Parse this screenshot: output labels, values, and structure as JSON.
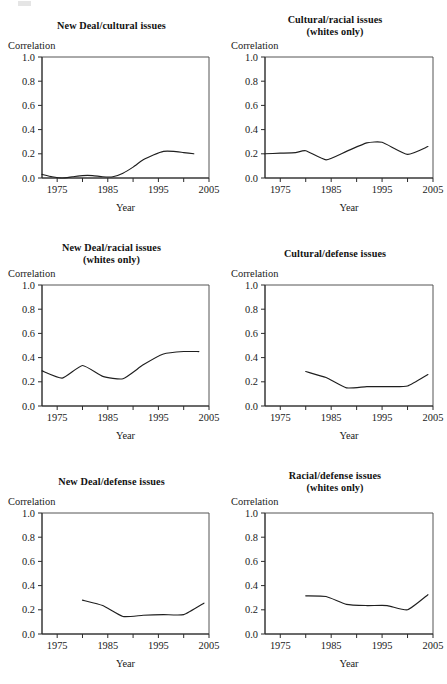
{
  "figure": {
    "axis_label_y": "Correlation",
    "axis_label_x": "Year",
    "y_ticks": [
      "0.0",
      "0.2",
      "0.4",
      "0.6",
      "0.8",
      "1.0"
    ],
    "x_ticks": [
      "1975",
      "1985",
      "1995",
      "2005"
    ],
    "line_color": "#1f1f1f",
    "frame_color": "#555555",
    "background": "#ffffff"
  },
  "panels": [
    {
      "id": "new-deal-cultural-issues",
      "title": "New Deal/cultural issues",
      "subtitle": "",
      "ylabel": "Correlation",
      "xlabel": "Year"
    },
    {
      "id": "cultural-racial-issues-whites-only",
      "title": "Cultural/racial issues",
      "subtitle": "(whites only)",
      "ylabel": "Correlation",
      "xlabel": "Year"
    },
    {
      "id": "new-deal-racial-issues-whites-only",
      "title": "New Deal/racial issues",
      "subtitle": "(whites only)",
      "ylabel": "Correlation",
      "xlabel": "Year"
    },
    {
      "id": "cultural-defense-issues",
      "title": "Cultural/defense issues",
      "subtitle": "",
      "ylabel": "Correlation",
      "xlabel": "Year"
    },
    {
      "id": "new-deal-defense-issues",
      "title": "New Deal/defense issues",
      "subtitle": "",
      "ylabel": "Correlation",
      "xlabel": "Year"
    },
    {
      "id": "racial-defense-issues-whites-only",
      "title": "Racial/defense issues",
      "subtitle": "(whites only)",
      "ylabel": "Correlation",
      "xlabel": "Year"
    }
  ],
  "chart_data": [
    {
      "type": "line",
      "title": "New Deal/cultural issues",
      "subtitle": "",
      "xlabel": "Year",
      "ylabel": "Correlation",
      "xlim": [
        1972,
        2005
      ],
      "ylim": [
        0.0,
        1.0
      ],
      "x_ticks": [
        1975,
        1985,
        1995,
        2005
      ],
      "y_ticks": [
        0.0,
        0.2,
        0.4,
        0.6,
        0.8,
        1.0
      ],
      "grid": false,
      "legend": "none",
      "x": [
        1972,
        1974,
        1976,
        1978,
        1980,
        1982,
        1984,
        1986,
        1988,
        1990,
        1992,
        1994,
        1996,
        1998,
        2000,
        2002
      ],
      "values": [
        0.03,
        0.01,
        0.0,
        0.01,
        0.02,
        0.02,
        0.01,
        0.01,
        0.04,
        0.09,
        0.15,
        0.19,
        0.22,
        0.22,
        0.21,
        0.2
      ]
    },
    {
      "type": "line",
      "title": "Cultural/racial issues",
      "subtitle": "(whites only)",
      "xlabel": "Year",
      "ylabel": "Correlation",
      "xlim": [
        1972,
        2005
      ],
      "ylim": [
        0.0,
        1.0
      ],
      "x_ticks": [
        1975,
        1985,
        1995,
        2005
      ],
      "y_ticks": [
        0.0,
        0.2,
        0.4,
        0.6,
        0.8,
        1.0
      ],
      "grid": false,
      "legend": "none",
      "x": [
        1972,
        1975,
        1978,
        1980,
        1984,
        1988,
        1992,
        1995,
        2000,
        2004
      ],
      "values": [
        0.2,
        0.205,
        0.21,
        0.225,
        0.15,
        0.22,
        0.29,
        0.295,
        0.195,
        0.26
      ]
    },
    {
      "type": "line",
      "title": "New Deal/racial issues",
      "subtitle": "(whites only)",
      "xlabel": "Year",
      "ylabel": "Correlation",
      "xlim": [
        1972,
        2005
      ],
      "ylim": [
        0.0,
        1.0
      ],
      "x_ticks": [
        1975,
        1985,
        1995,
        2005
      ],
      "y_ticks": [
        0.0,
        0.2,
        0.4,
        0.6,
        0.8,
        1.0
      ],
      "grid": false,
      "legend": "none",
      "x": [
        1972,
        1976,
        1980,
        1984,
        1988,
        1992,
        1996,
        2000,
        2003
      ],
      "values": [
        0.29,
        0.23,
        0.335,
        0.245,
        0.225,
        0.34,
        0.43,
        0.45,
        0.45
      ]
    },
    {
      "type": "line",
      "title": "Cultural/defense issues",
      "subtitle": "",
      "xlabel": "Year",
      "ylabel": "Correlation",
      "xlim": [
        1972,
        2005
      ],
      "ylim": [
        0.0,
        1.0
      ],
      "x_ticks": [
        1975,
        1985,
        1995,
        2005
      ],
      "y_ticks": [
        0.0,
        0.2,
        0.4,
        0.6,
        0.8,
        1.0
      ],
      "grid": false,
      "legend": "none",
      "x": [
        1980,
        1984,
        1988,
        1992,
        1996,
        2000,
        2004
      ],
      "values": [
        0.285,
        0.235,
        0.15,
        0.16,
        0.16,
        0.165,
        0.26
      ]
    },
    {
      "type": "line",
      "title": "New Deal/defense issues",
      "subtitle": "",
      "xlabel": "Year",
      "ylabel": "Correlation",
      "xlim": [
        1972,
        2005
      ],
      "ylim": [
        0.0,
        1.0
      ],
      "x_ticks": [
        1975,
        1985,
        1995,
        2005
      ],
      "y_ticks": [
        0.0,
        0.2,
        0.4,
        0.6,
        0.8,
        1.0
      ],
      "grid": false,
      "legend": "none",
      "x": [
        1980,
        1984,
        1988,
        1992,
        1996,
        2000,
        2004
      ],
      "values": [
        0.28,
        0.235,
        0.145,
        0.155,
        0.16,
        0.16,
        0.255
      ]
    },
    {
      "type": "line",
      "title": "Racial/defense issues",
      "subtitle": "(whites only)",
      "xlabel": "Year",
      "ylabel": "Correlation",
      "xlim": [
        1972,
        2005
      ],
      "ylim": [
        0.0,
        1.0
      ],
      "x_ticks": [
        1975,
        1985,
        1995,
        2005
      ],
      "y_ticks": [
        0.0,
        0.2,
        0.4,
        0.6,
        0.8,
        1.0
      ],
      "grid": false,
      "legend": "none",
      "x": [
        1980,
        1984,
        1988,
        1992,
        1996,
        2000,
        2004
      ],
      "values": [
        0.315,
        0.31,
        0.245,
        0.235,
        0.235,
        0.2,
        0.325
      ]
    }
  ]
}
